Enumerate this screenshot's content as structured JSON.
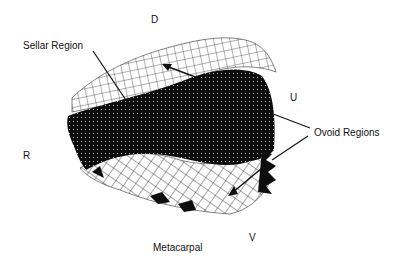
{
  "figure": {
    "type": "3d-wireframe-surface",
    "axis_labels": {
      "top": "D",
      "right": "U",
      "left": "R",
      "bottom": "V"
    },
    "annotations": {
      "sellar": "Sellar Region",
      "ovoid": "Ovoid Regions",
      "bone": "Metacarpal"
    },
    "colors": {
      "surface_dark": "#0d0d0d",
      "mesh_line": "#1a1a1a",
      "background": "#ffffff"
    }
  }
}
